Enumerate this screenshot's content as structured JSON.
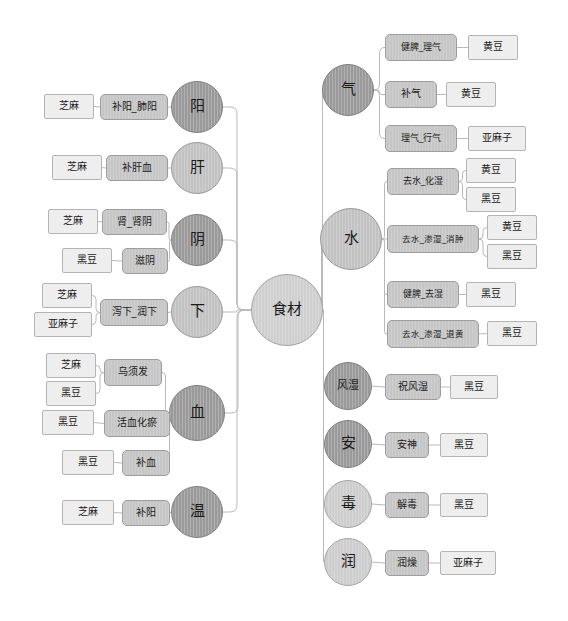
{
  "diagram": {
    "type": "mindmap",
    "background_color": "#ffffff",
    "edge_color": "#b9b9b9",
    "root": {
      "label": "食材",
      "cx": 287,
      "cy": 310,
      "r": 36,
      "shade": "root"
    },
    "left_branches": [
      {
        "label": "阳",
        "cx": 197,
        "cy": 107,
        "r": 26,
        "shade": "dark",
        "functions": [
          {
            "label": "补阳_肺阳",
            "x": 100,
            "y": 94,
            "w": 68,
            "h": 26,
            "ingredients": [
              {
                "label": "芝麻",
                "x": 44,
                "y": 94,
                "w": 50,
                "h": 25
              }
            ]
          }
        ]
      },
      {
        "label": "肝",
        "cx": 197,
        "cy": 168,
        "r": 26,
        "shade": "light",
        "functions": [
          {
            "label": "补肝血",
            "x": 106,
            "y": 155,
            "w": 62,
            "h": 26,
            "ingredients": [
              {
                "label": "芝麻",
                "x": 52,
                "y": 155,
                "w": 50,
                "h": 25
              }
            ]
          }
        ]
      },
      {
        "label": "阴",
        "cx": 197,
        "cy": 240,
        "r": 26,
        "shade": "dark",
        "functions": [
          {
            "label": "肾_肾阴",
            "x": 102,
            "y": 209,
            "w": 65,
            "h": 26,
            "ingredients": [
              {
                "label": "芝麻",
                "x": 48,
                "y": 209,
                "w": 50,
                "h": 25
              }
            ]
          },
          {
            "label": "滋阴",
            "x": 122,
            "y": 248,
            "w": 46,
            "h": 26,
            "ingredients": [
              {
                "label": "黑豆",
                "x": 62,
                "y": 248,
                "w": 50,
                "h": 25
              }
            ]
          }
        ]
      },
      {
        "label": "下",
        "cx": 197,
        "cy": 312,
        "r": 26,
        "shade": "light",
        "functions": [
          {
            "label": "泻下_润下",
            "x": 100,
            "y": 299,
            "w": 68,
            "h": 27,
            "ingredients": [
              {
                "label": "芝麻",
                "x": 42,
                "y": 283,
                "w": 50,
                "h": 25
              },
              {
                "label": "亚麻子",
                "x": 34,
                "y": 312,
                "w": 58,
                "h": 25
              }
            ]
          }
        ]
      },
      {
        "label": "血",
        "cx": 197,
        "cy": 413,
        "r": 28,
        "shade": "dark",
        "functions": [
          {
            "label": "乌须发",
            "x": 104,
            "y": 359,
            "w": 58,
            "h": 27,
            "ingredients": [
              {
                "label": "芝麻",
                "x": 46,
                "y": 353,
                "w": 50,
                "h": 25
              },
              {
                "label": "黑豆",
                "x": 46,
                "y": 381,
                "w": 50,
                "h": 25
              }
            ]
          },
          {
            "label": "活血化瘀",
            "x": 104,
            "y": 410,
            "w": 66,
            "h": 27,
            "ingredients": [
              {
                "label": "黑豆",
                "x": 42,
                "y": 410,
                "w": 52,
                "h": 25
              }
            ]
          },
          {
            "label": "补血",
            "x": 122,
            "y": 450,
            "w": 48,
            "h": 26,
            "ingredients": [
              {
                "label": "黑豆",
                "x": 62,
                "y": 450,
                "w": 52,
                "h": 25
              }
            ]
          }
        ]
      },
      {
        "label": "温",
        "cx": 197,
        "cy": 512,
        "r": 26,
        "shade": "dark",
        "functions": [
          {
            "label": "补阳",
            "x": 122,
            "y": 500,
            "w": 48,
            "h": 26,
            "ingredients": [
              {
                "label": "芝麻",
                "x": 62,
                "y": 500,
                "w": 52,
                "h": 25
              }
            ]
          }
        ]
      }
    ],
    "right_branches": [
      {
        "label": "气",
        "cx": 348,
        "cy": 90,
        "r": 26,
        "shade": "dark",
        "functions": [
          {
            "label": "健脾_理气",
            "x": 385,
            "y": 34,
            "w": 72,
            "h": 27,
            "ingredients": [
              {
                "label": "黄豆",
                "x": 468,
                "y": 35,
                "w": 50,
                "h": 25
              }
            ]
          },
          {
            "label": "补气",
            "x": 385,
            "y": 81,
            "w": 52,
            "h": 27,
            "ingredients": [
              {
                "label": "黄豆",
                "x": 446,
                "y": 82,
                "w": 50,
                "h": 25
              }
            ]
          },
          {
            "label": "理气_行气",
            "x": 385,
            "y": 125,
            "w": 72,
            "h": 27,
            "ingredients": [
              {
                "label": "亚麻子",
                "x": 468,
                "y": 126,
                "w": 58,
                "h": 25
              }
            ]
          }
        ]
      },
      {
        "label": "水",
        "cx": 351,
        "cy": 239,
        "r": 31,
        "shade": "light",
        "functions": [
          {
            "label": "去水_化湿",
            "x": 387,
            "y": 168,
            "w": 72,
            "h": 27,
            "ingredients": [
              {
                "label": "黄豆",
                "x": 466,
                "y": 158,
                "w": 50,
                "h": 25
              },
              {
                "label": "黑豆",
                "x": 466,
                "y": 187,
                "w": 50,
                "h": 25
              }
            ]
          },
          {
            "label": "去水_渗湿_消肿",
            "x": 387,
            "y": 225,
            "w": 92,
            "h": 28,
            "ingredients": [
              {
                "label": "黄豆",
                "x": 487,
                "y": 215,
                "w": 50,
                "h": 25
              },
              {
                "label": "黑豆",
                "x": 487,
                "y": 244,
                "w": 50,
                "h": 25
              }
            ]
          },
          {
            "label": "健脾_去湿",
            "x": 387,
            "y": 281,
            "w": 72,
            "h": 27,
            "ingredients": [
              {
                "label": "黑豆",
                "x": 466,
                "y": 282,
                "w": 50,
                "h": 25
              }
            ]
          },
          {
            "label": "去水_渗湿_退黄",
            "x": 387,
            "y": 320,
            "w": 92,
            "h": 28,
            "ingredients": [
              {
                "label": "黑豆",
                "x": 487,
                "y": 321,
                "w": 50,
                "h": 25
              }
            ]
          }
        ]
      },
      {
        "label": "风湿",
        "cx": 348,
        "cy": 386,
        "r": 24,
        "shade": "dark",
        "functions": [
          {
            "label": "祝风湿",
            "x": 385,
            "y": 374,
            "w": 56,
            "h": 26,
            "ingredients": [
              {
                "label": "黑豆",
                "x": 450,
                "y": 375,
                "w": 48,
                "h": 24
              }
            ]
          }
        ]
      },
      {
        "label": "安",
        "cx": 348,
        "cy": 444,
        "r": 24,
        "shade": "dark",
        "functions": [
          {
            "label": "安神",
            "x": 385,
            "y": 432,
            "w": 44,
            "h": 26,
            "ingredients": [
              {
                "label": "黑豆",
                "x": 440,
                "y": 433,
                "w": 48,
                "h": 24
              }
            ]
          }
        ]
      },
      {
        "label": "毒",
        "cx": 348,
        "cy": 504,
        "r": 24,
        "shade": "xlight",
        "functions": [
          {
            "label": "解毒",
            "x": 385,
            "y": 492,
            "w": 44,
            "h": 26,
            "ingredients": [
              {
                "label": "黑豆",
                "x": 440,
                "y": 493,
                "w": 48,
                "h": 24
              }
            ]
          }
        ]
      },
      {
        "label": "润",
        "cx": 348,
        "cy": 562,
        "r": 24,
        "shade": "xlight",
        "functions": [
          {
            "label": "润燥",
            "x": 385,
            "y": 550,
            "w": 44,
            "h": 26,
            "ingredients": [
              {
                "label": "亚麻子",
                "x": 440,
                "y": 551,
                "w": 56,
                "h": 24
              }
            ]
          }
        ]
      }
    ]
  }
}
